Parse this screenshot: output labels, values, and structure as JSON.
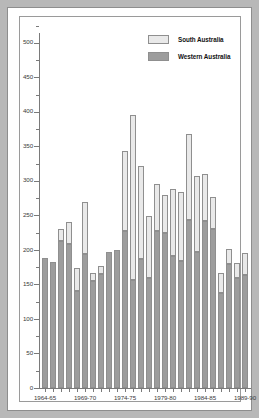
{
  "chart_data": {
    "type": "bar",
    "subtype": "stacked-bar",
    "title": "",
    "xlabel": "",
    "ylabel": "",
    "ylim": [
      0,
      520
    ],
    "ytick_major_step": 50,
    "ytick_minor_step": 25,
    "grid": false,
    "legend_position": "top-right",
    "categories": [
      "1964-65",
      "1965-66",
      "1966-67",
      "1967-68",
      "1968-69",
      "1969-70",
      "1970-71",
      "1971-72",
      "1972-73",
      "1973-74",
      "1974-75",
      "1975-76",
      "1976-77",
      "1977-78",
      "1978-79",
      "1979-80",
      "1980-81",
      "1981-82",
      "1982-83",
      "1983-84",
      "1984-85",
      "1985-86",
      "1986-87",
      "1987-88",
      "1988-89",
      "1989-90"
    ],
    "xtick_labels_shown": [
      "1964-65",
      "1969-70",
      "1974-75",
      "1979-80",
      "1984-85",
      "1989-90"
    ],
    "ytick_labels": [
      "0",
      "50",
      "100",
      "150",
      "200",
      "250",
      "300",
      "350",
      "400",
      "450",
      "500"
    ],
    "series": [
      {
        "name": "Western Australia",
        "color": "#9d9d9d",
        "values": [
          188,
          182,
          213,
          208,
          140,
          194,
          155,
          165,
          197,
          200,
          228,
          157,
          187,
          160,
          227,
          225,
          191,
          184,
          243,
          197,
          242,
          230,
          138,
          180,
          159,
          164
        ]
      },
      {
        "name": "South Australia",
        "color": "#e9e9e9",
        "values": [
          0,
          0,
          18,
          32,
          34,
          75,
          12,
          11,
          0,
          0,
          116,
          238,
          134,
          89,
          68,
          55,
          97,
          100,
          125,
          110,
          68,
          47,
          28,
          22,
          22,
          31
        ]
      }
    ],
    "totals": [
      188,
      182,
      231,
      240,
      174,
      269,
      167,
      176,
      197,
      200,
      344,
      395,
      321,
      249,
      295,
      280,
      288,
      284,
      368,
      307,
      310,
      277,
      166,
      202,
      181,
      195
    ]
  },
  "legend": {
    "items": [
      {
        "label": "South Australia",
        "swatch": "sa"
      },
      {
        "label": "Western Australia",
        "swatch": "wa"
      }
    ]
  }
}
